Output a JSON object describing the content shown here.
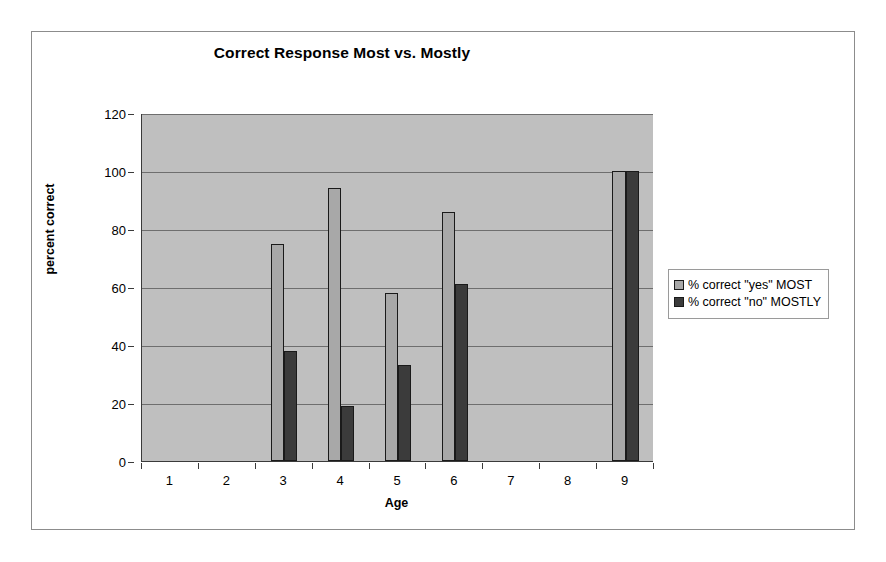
{
  "chart_data": {
    "type": "bar",
    "title": "Correct Response Most vs. Mostly",
    "xlabel": "Age",
    "ylabel": "percent correct",
    "categories": [
      "1",
      "2",
      "3",
      "4",
      "5",
      "6",
      "7",
      "8",
      "9"
    ],
    "ylim": [
      0,
      120
    ],
    "yticks": [
      "0",
      "20",
      "40",
      "60",
      "80",
      "100",
      "120"
    ],
    "ytick_values": [
      0,
      20,
      40,
      60,
      80,
      100,
      120
    ],
    "grid": true,
    "legend_position": "right",
    "series": [
      {
        "name": "% correct \"yes\" MOST",
        "color": "#a8a8a8",
        "values": [
          null,
          null,
          75,
          94,
          58,
          86,
          null,
          null,
          100
        ]
      },
      {
        "name": "% correct \"no\" MOSTLY",
        "color": "#3b3b3b",
        "values": [
          null,
          null,
          38,
          19,
          33,
          61,
          null,
          null,
          100
        ]
      }
    ],
    "plot_background": "#bfbfbf",
    "figure_background": "#ffffff"
  }
}
